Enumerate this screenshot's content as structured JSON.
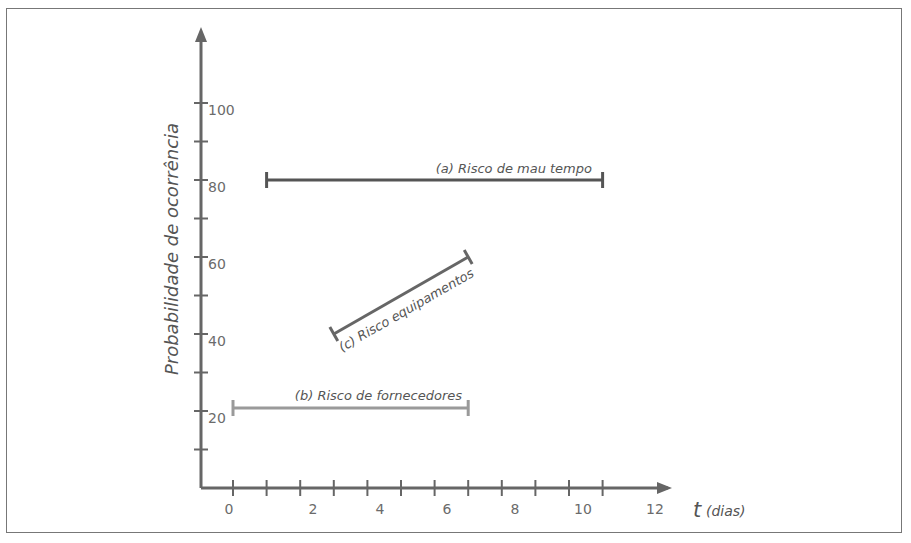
{
  "chart_data": {
    "type": "range-lines",
    "title": "",
    "xlabel": "t",
    "xlabel_unit": "(dias)",
    "ylabel": "Probabilidade de ocorrência",
    "x_ticks": [
      0,
      1,
      2,
      3,
      4,
      5,
      6,
      7,
      8,
      9,
      10,
      11
    ],
    "x_tick_labels": [
      "0",
      "2",
      "4",
      "6",
      "8",
      "10",
      "12"
    ],
    "y_ticks": [
      10,
      20,
      30,
      40,
      50,
      60,
      70,
      80,
      90,
      100
    ],
    "y_tick_labels": [
      "20",
      "40",
      "60",
      "80",
      "100"
    ],
    "xlim": [
      0,
      12
    ],
    "ylim": [
      0,
      110
    ],
    "grid": false,
    "legend": "none (inline labels)",
    "series": [
      {
        "name": "(a) Risco de mau tempo",
        "x": [
          1,
          11
        ],
        "y": [
          80,
          80
        ],
        "color": "#555555"
      },
      {
        "name": "(b) Risco de fornecedores",
        "x": [
          0,
          7
        ],
        "y": [
          20,
          20
        ],
        "color": "#9a9a9a"
      },
      {
        "name": "(c) Risco equipamentos",
        "x": [
          3,
          7
        ],
        "y": [
          40,
          60
        ],
        "color": "#666666"
      }
    ]
  },
  "colors": {
    "axis": "#666666",
    "frame": "#777777",
    "text": "#6b6b6b"
  }
}
